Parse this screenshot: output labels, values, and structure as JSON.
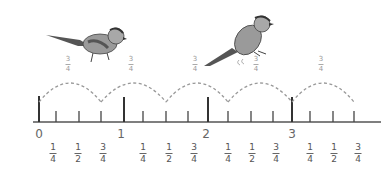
{
  "diagram": {
    "type": "number-line",
    "jump_label": {
      "num": "3",
      "den": "4"
    },
    "jump_count": 5,
    "whole_labels": [
      "0",
      "1",
      "2",
      "3"
    ],
    "fraction_labels": [
      {
        "num": "1",
        "den": "4"
      },
      {
        "num": "1",
        "den": "2"
      },
      {
        "num": "3",
        "den": "4"
      },
      {
        "num": "1",
        "den": "4"
      },
      {
        "num": "1",
        "den": "2"
      },
      {
        "num": "3",
        "den": "4"
      },
      {
        "num": "1",
        "den": "4"
      },
      {
        "num": "1",
        "den": "2"
      },
      {
        "num": "3",
        "den": "4"
      },
      {
        "num": "1",
        "den": "4"
      },
      {
        "num": "1",
        "den": "2"
      },
      {
        "num": "3",
        "den": "4"
      }
    ],
    "birds": [
      "bird-left",
      "bird-right"
    ],
    "colors": {
      "line": "#555555",
      "arc": "#999999",
      "bird_body": "#8a8a8a",
      "bird_dark": "#444444"
    }
  }
}
